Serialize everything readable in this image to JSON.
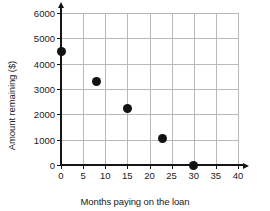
{
  "chart_data": {
    "type": "scatter",
    "title": "",
    "xlabel": "Months paying on the loan",
    "ylabel": "Amount remaining ($)",
    "xlim": [
      0,
      40
    ],
    "ylim": [
      0,
      6000
    ],
    "xticks": [
      0,
      5,
      10,
      15,
      20,
      25,
      30,
      35,
      40
    ],
    "yticks": [
      0,
      1000,
      2000,
      3000,
      4000,
      5000,
      6000
    ],
    "xtick_labels": [
      "0",
      "5",
      "10",
      "15",
      "20",
      "25",
      "30",
      "35",
      "40"
    ],
    "ytick_labels": [
      "0",
      "1000",
      "2000",
      "3000",
      "4000",
      "5000",
      "6000"
    ],
    "grid": true,
    "legend": null,
    "marker_color": "#121212",
    "axis_color": "#141414",
    "grid_color": "#b9b9b9",
    "points": [
      {
        "x": 0,
        "y": 4500
      },
      {
        "x": 8,
        "y": 3300
      },
      {
        "x": 15,
        "y": 2250
      },
      {
        "x": 23,
        "y": 1050
      },
      {
        "x": 30,
        "y": 0
      }
    ]
  }
}
